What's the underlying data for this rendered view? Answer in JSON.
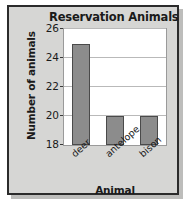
{
  "chart_data": {
    "type": "bar",
    "title": "Reservation Animals",
    "xlabel": "Animal",
    "ylabel": "Number of animals",
    "categories": [
      "deer",
      "antelope",
      "bison"
    ],
    "values": [
      25,
      20,
      20
    ],
    "ylim": [
      18,
      26
    ],
    "yticks": [
      18,
      20,
      22,
      24,
      26
    ],
    "grid": "horizontal",
    "legend": null,
    "bar_color": "#8c8c8c",
    "bar_edge_color": "#4a4a4a",
    "plot_background": "#ffffff",
    "figure_background": "#d6d6d4",
    "frame_color": "#2b2b2b",
    "gridline_color": "#b9b9b9",
    "text_color": "#1a1a1a"
  }
}
